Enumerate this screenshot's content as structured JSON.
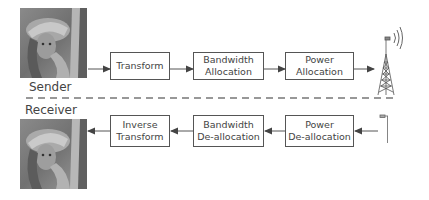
{
  "sender": {
    "label": "Sender",
    "blocks": [
      {
        "line1": "Transform",
        "line2": ""
      },
      {
        "line1": "Bandwidth",
        "line2": "Allocation"
      },
      {
        "line1": "Power",
        "line2": "Allocation"
      }
    ],
    "icon": "transmit-tower-icon"
  },
  "receiver": {
    "label": "Receiver",
    "blocks": [
      {
        "line1": "Inverse",
        "line2": "Transform"
      },
      {
        "line1": "Bandwidth",
        "line2": "De-allocation"
      },
      {
        "line1": "Power",
        "line2": "De-allocation"
      }
    ],
    "icon": "receive-antenna-icon"
  },
  "colors": {
    "stroke": "#555555",
    "text": "#444444",
    "dash": "#777777"
  }
}
